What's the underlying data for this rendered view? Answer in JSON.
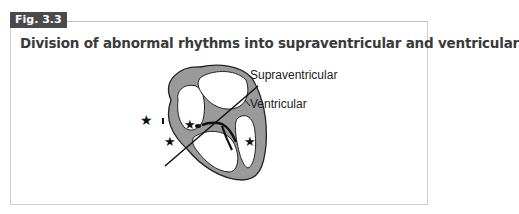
{
  "figure": {
    "badge": "Fig. 3.3",
    "title": "Division of abnormal rhythms into supraventricular and ventricular"
  },
  "diagram": {
    "labels": {
      "supraventricular": "Supraventricular",
      "ventricular": "Ventricular"
    },
    "markers": "star",
    "colors": {
      "myocardium": "#9a9a9a",
      "outline": "#222222",
      "badge_bg": "#4a4a4a"
    }
  }
}
